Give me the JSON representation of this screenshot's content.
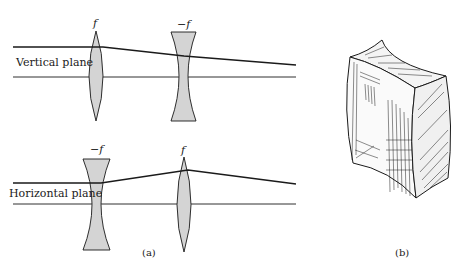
{
  "figure": {
    "panel_a": {
      "caption": "(a)",
      "vertical": {
        "plane_label": "Vertical plane",
        "lens1_label": "f",
        "lens1_type": "converging",
        "lens2_label": "−f",
        "lens2_type": "diverging"
      },
      "horizontal": {
        "plane_label": "Horizontal plane",
        "lens1_label": "−f",
        "lens1_type": "diverging",
        "lens2_label": "f",
        "lens2_type": "converging"
      }
    },
    "panel_b": {
      "caption": "(b)",
      "description": "Hatched 3D quadrupole-shaped block with concave faces"
    },
    "colors": {
      "lens_fill": "#d4d4d4",
      "stroke": "#1a1a1a",
      "background": "#ffffff"
    }
  }
}
